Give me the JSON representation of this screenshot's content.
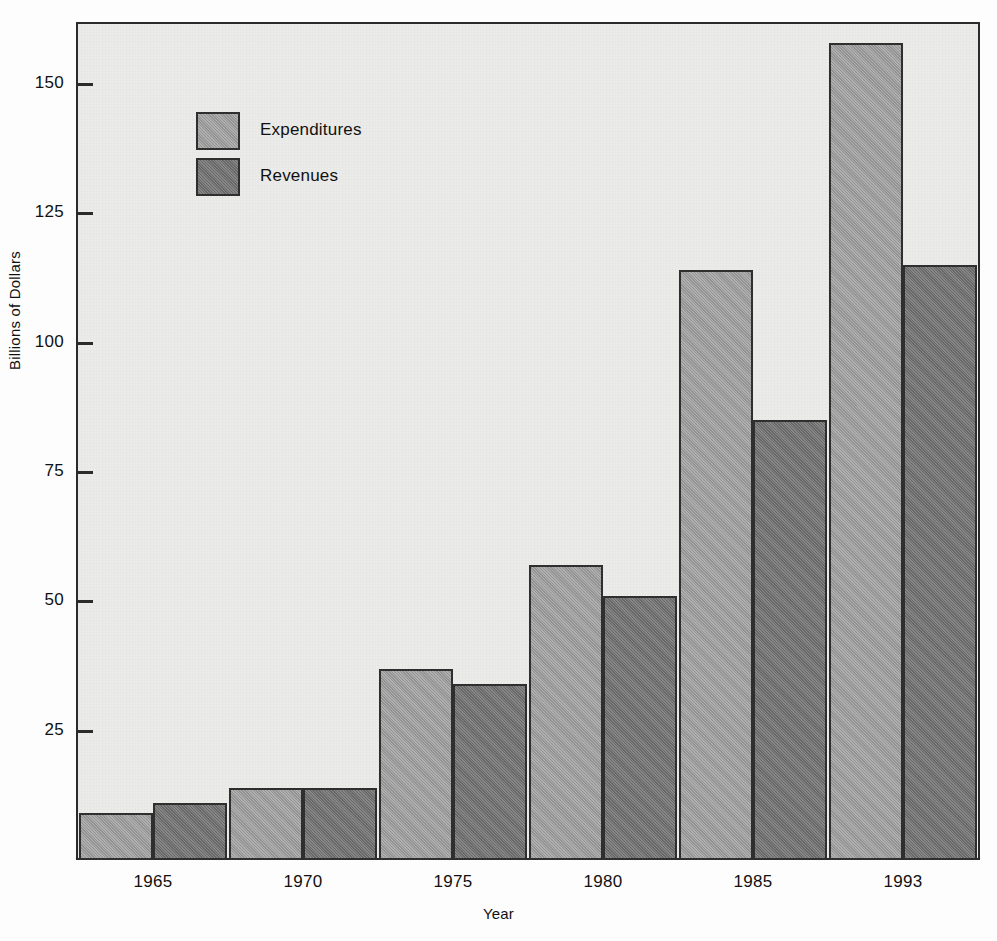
{
  "chart_data": {
    "type": "bar",
    "title": "",
    "xlabel": "Year",
    "ylabel": "Billions of Dollars",
    "categories": [
      "1965",
      "1970",
      "1975",
      "1980",
      "1985",
      "1993"
    ],
    "series": [
      {
        "name": "Expenditures",
        "color": "#9b9b9b",
        "values": [
          9,
          14,
          37,
          57,
          114,
          158
        ]
      },
      {
        "name": "Revenues",
        "color": "#6f6f6f",
        "values": [
          11,
          14,
          34,
          51,
          85,
          115
        ]
      }
    ],
    "yticks": [
      25,
      50,
      75,
      100,
      125,
      150
    ],
    "ylim": [
      0,
      162
    ],
    "grid": false,
    "legend_position": "upper-left-inside",
    "plot_background": "#ebebe9",
    "frame_color": "#2b2b2b"
  },
  "legend": {
    "items": [
      {
        "label": "Expenditures",
        "swatch": "light-gray-swatch"
      },
      {
        "label": "Revenues",
        "swatch": "dark-gray-swatch"
      }
    ]
  },
  "axes": {
    "y_title": "Billions of Dollars",
    "x_title": "Year",
    "y_tick_labels": [
      "150",
      "125",
      "100",
      "75",
      "50",
      "25"
    ],
    "x_tick_labels": [
      "1965",
      "1970",
      "1975",
      "1980",
      "1985",
      "1993"
    ]
  }
}
